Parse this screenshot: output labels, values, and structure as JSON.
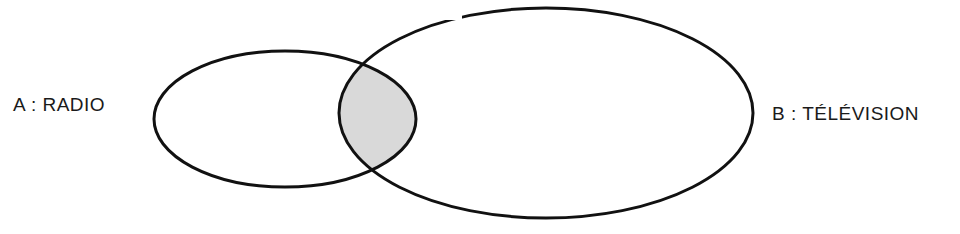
{
  "diagram": {
    "type": "venn",
    "sets": [
      {
        "id": "A",
        "label": "A : RADIO",
        "cx": 285,
        "cy": 119,
        "rx": 131,
        "ry": 68
      },
      {
        "id": "B",
        "label": "B : TÉLÉVISION",
        "cx": 546,
        "cy": 113,
        "rx": 207,
        "ry": 105
      }
    ],
    "intersection": {
      "sets": [
        "A",
        "B"
      ],
      "fill": "#d9d9d9",
      "shaded": true
    },
    "stroke_color": "#111111",
    "background": "#ffffff"
  }
}
